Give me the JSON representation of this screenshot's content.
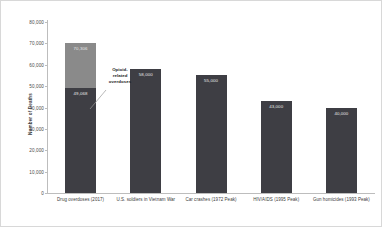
{
  "chart_data": {
    "type": "bar",
    "title": "",
    "xlabel": "",
    "ylabel": "Number of Deaths",
    "ylim": [
      0,
      80000
    ],
    "ytick_values": [
      80000,
      70000,
      60000,
      50000,
      40000,
      30000,
      20000,
      10000,
      0
    ],
    "ytick_labels": [
      "80,000",
      "70,000",
      "60,000",
      "50,000",
      "40,000",
      "30,000",
      "20,000",
      "10,000",
      "0"
    ],
    "grid": false,
    "legend": "none",
    "stacked": true,
    "categories": [
      "Drug overdoses (2017)",
      "U.S. soldiers in Vietnam War",
      "Car crashes (1972 Peak)",
      "HIV/AIDS (1995 Peak)",
      "Gun homicides (1993 Peak)"
    ],
    "series": [
      {
        "name": "Opioid-related overdoses",
        "color": "#3e3e44",
        "values": [
          49068,
          58000,
          55000,
          43000,
          40000
        ],
        "value_labels": [
          "49,068",
          "58,000",
          "55,000",
          "43,000",
          "40,000"
        ]
      },
      {
        "name": "Other overdoses",
        "color": "#8a8a8a",
        "values": [
          21238,
          0,
          0,
          0,
          0
        ],
        "totals": [
          70306,
          58000,
          55000,
          43000,
          40000
        ],
        "total_labels": [
          "70,306",
          "",
          "",
          "",
          ""
        ]
      }
    ],
    "annotations": [
      {
        "name": "opioid-callout",
        "text_lines": [
          "Opioid-",
          "related",
          "overdoses"
        ],
        "points_to": "Drug overdoses (2017) lower segment"
      }
    ],
    "colors": {
      "bar_dark": "#3e3e44",
      "bar_light": "#8a8a8a",
      "axis": "#bdbdbd",
      "text": "#3a3a3a",
      "label_on_bar": "#e8e8e8",
      "frame": "#d8d8d8",
      "background": "#ffffff"
    }
  }
}
